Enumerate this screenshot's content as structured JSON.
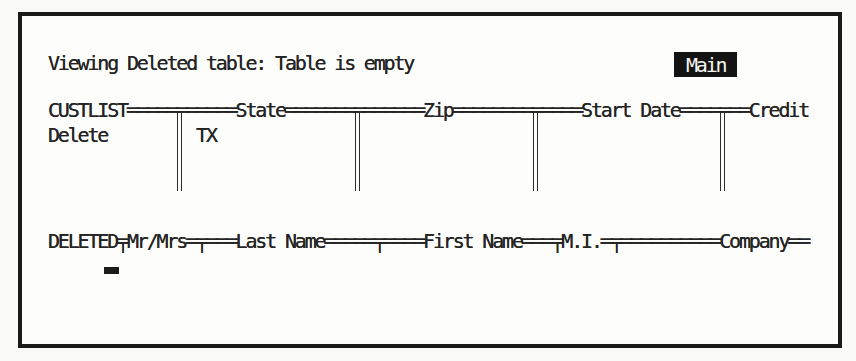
{
  "palette": {
    "paper": "#fdfdfb",
    "ink": "#242424",
    "frame_border": "#1a1a1a",
    "badge_bg": "#131313",
    "badge_text": "#f6f6f1"
  },
  "status": {
    "message": "Viewing Deleted table: Table is empty",
    "mode": "Main"
  },
  "custlist_table": {
    "name": "CUSTLIST",
    "visible_fields": [
      "State",
      "Zip",
      "Start Date",
      "Credit"
    ],
    "header_line": "CUSTLIST═══════════State══════════════Zip═════════════Start Date═══════Credit",
    "record_line": "Delete         TX",
    "record": {
      "status_marker": "Delete",
      "state_value": "TX"
    }
  },
  "deleted_table": {
    "name": "DELETED",
    "visible_fields": [
      "Mr/Mrs",
      "Last Name",
      "First Name",
      "M.I.",
      "Company"
    ],
    "header_line": "DELETED╤Mr/Mrs═╤═══Last Name═════╤════First Name═══╤M.I.═╤══════════Company══"
  }
}
